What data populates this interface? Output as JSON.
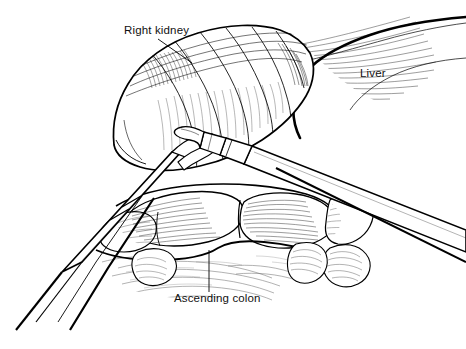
{
  "figure": {
    "kind": "medical-line-drawing",
    "background_color": "#ffffff",
    "ink_color": "#000000",
    "width": 466,
    "height": 349
  },
  "labels": [
    {
      "id": "right-kidney",
      "text": "Right kidney",
      "x": 124,
      "y": 34,
      "anchor": "start",
      "leader": {
        "x1": 158,
        "y1": 39,
        "x2": 192,
        "y2": 63
      }
    },
    {
      "id": "liver",
      "text": "Liver",
      "x": 360,
      "y": 77,
      "anchor": "start",
      "leader": null
    },
    {
      "id": "ascending-colon",
      "text": "Ascending colon",
      "x": 174,
      "y": 302,
      "anchor": "start",
      "leader": {
        "x1": 209,
        "y1": 250,
        "x2": 209,
        "y2": 292
      }
    }
  ],
  "anatomy": [
    {
      "id": "right-kidney",
      "name": "Right kidney",
      "region": "upper-left-center"
    },
    {
      "id": "liver",
      "name": "Liver",
      "region": "upper-right"
    },
    {
      "id": "ascending-colon",
      "name": "Ascending colon",
      "region": "lower-center"
    },
    {
      "id": "retroperitoneal-tissue",
      "name": "Retroperitoneal tissue",
      "region": "lower"
    }
  ],
  "instruments": [
    {
      "id": "left-grasper",
      "name": "Laparoscopic grasper",
      "entry": "lower-left",
      "tip": "upper-right"
    },
    {
      "id": "right-dissector",
      "name": "Laparoscopic dissector",
      "entry": "lower-right",
      "tip": "center-left"
    }
  ]
}
